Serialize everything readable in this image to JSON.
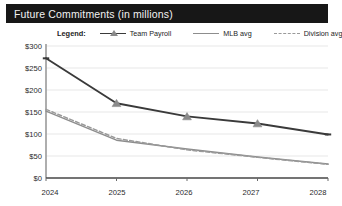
{
  "window": {
    "title": "Future Commitments (in millions)"
  },
  "legend": {
    "title": "Legend:",
    "items": [
      {
        "label": "Team Payroll",
        "style": "line-marker",
        "color": "#3a3a3a",
        "marker": "triangle-marker-icon"
      },
      {
        "label": "MLB avg",
        "style": "solid",
        "color": "#8d8d8d",
        "marker": "none"
      },
      {
        "label": "Division avg",
        "style": "dashed",
        "color": "#9a9a9a",
        "marker": "none"
      }
    ]
  },
  "chart_data": {
    "type": "line",
    "title": "Future Commitments (in millions)",
    "xlabel": "",
    "ylabel": "",
    "x": [
      "2024",
      "2025",
      "2026",
      "2027",
      "2028"
    ],
    "categories": [
      "2024",
      "2025",
      "2026",
      "2027",
      "2028"
    ],
    "yticks": [
      "$0",
      "$50",
      "$100",
      "$150",
      "$200",
      "$250",
      "$300"
    ],
    "ytick_values": [
      0,
      50,
      100,
      150,
      200,
      250,
      300
    ],
    "ylim": [
      0,
      300
    ],
    "grid": true,
    "legend_position": "top",
    "series": [
      {
        "name": "Team Payroll",
        "color": "#3a3a3a",
        "style": "solid",
        "marker": "triangle",
        "values": [
          272,
          170,
          140,
          124,
          99
        ]
      },
      {
        "name": "MLB avg",
        "color": "#8d8d8d",
        "style": "solid",
        "marker": "none",
        "values": [
          152,
          86,
          66,
          48,
          32
        ]
      },
      {
        "name": "Division avg",
        "color": "#9a9a9a",
        "style": "dashed",
        "marker": "none",
        "values": [
          156,
          90,
          64,
          47,
          31
        ]
      }
    ]
  },
  "axes": {
    "y": [
      "$300",
      "$250",
      "$200",
      "$150",
      "$100",
      "$50",
      "$0"
    ],
    "x": [
      "2024",
      "2025",
      "2026",
      "2027",
      "2028"
    ]
  }
}
